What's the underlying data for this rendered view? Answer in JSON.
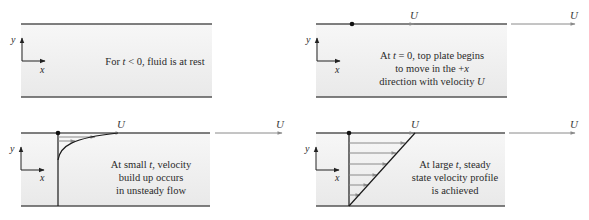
{
  "colors": {
    "plate": "#555555",
    "fluid_top": "#f6f6f6",
    "fluid_bottom": "#ebebeb",
    "arrow": "#888888",
    "profile": "#1a1a1a",
    "text": "#2a2a2a"
  },
  "axes": {
    "x_label": "x",
    "y_label": "y"
  },
  "velocity_label": "U",
  "panels": [
    {
      "id": "t-less-than-zero",
      "lines": [
        "For t < 0, fluid is at rest"
      ],
      "line_parts": [
        [
          "For ",
          "t",
          " < 0, fluid is at rest"
        ]
      ]
    },
    {
      "id": "t-equals-zero",
      "lines": [
        "At t = 0, top plate begins",
        "to move in the +x",
        "direction with velocity U"
      ],
      "line_parts": [
        [
          "At ",
          "t",
          " = 0, top plate begins"
        ],
        [
          "to move in the +",
          "x",
          ""
        ],
        [
          "direction with velocity ",
          "U",
          ""
        ]
      ]
    },
    {
      "id": "small-t",
      "lines": [
        "At small t, velocity",
        "build up occurs",
        "in unsteady flow"
      ],
      "line_parts": [
        [
          "At small ",
          "t",
          ", velocity"
        ],
        [
          "build up occurs",
          "",
          ""
        ],
        [
          "in unsteady flow",
          "",
          ""
        ]
      ]
    },
    {
      "id": "large-t",
      "lines": [
        "At large t, steady",
        "state velocity profile",
        "is achieved"
      ],
      "line_parts": [
        [
          "At large ",
          "t",
          ", steady"
        ],
        [
          "state velocity profile",
          "",
          ""
        ],
        [
          "is achieved",
          "",
          ""
        ]
      ]
    }
  ]
}
